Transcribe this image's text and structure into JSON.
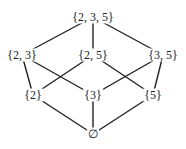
{
  "diagram": {
    "type": "hasse-diagram",
    "line_color": "#222222",
    "nodes": [
      {
        "id": "n235",
        "label": "{2, 3, 5}",
        "x": 93,
        "y": 17
      },
      {
        "id": "n23",
        "label": "{2, 3}",
        "x": 22,
        "y": 55
      },
      {
        "id": "n25",
        "label": "{2, 5}",
        "x": 93,
        "y": 55
      },
      {
        "id": "n35",
        "label": "{3, 5}",
        "x": 163,
        "y": 55
      },
      {
        "id": "n2",
        "label": "{2}",
        "x": 33,
        "y": 95
      },
      {
        "id": "n3",
        "label": "{3}",
        "x": 93,
        "y": 95
      },
      {
        "id": "n5",
        "label": "{5}",
        "x": 153,
        "y": 95
      },
      {
        "id": "nempty",
        "label": "∅",
        "x": 93,
        "y": 134
      }
    ],
    "edges": [
      [
        "n235",
        "n23"
      ],
      [
        "n235",
        "n25"
      ],
      [
        "n235",
        "n35"
      ],
      [
        "n23",
        "n2"
      ],
      [
        "n23",
        "n3"
      ],
      [
        "n25",
        "n2"
      ],
      [
        "n25",
        "n5"
      ],
      [
        "n35",
        "n3"
      ],
      [
        "n35",
        "n5"
      ],
      [
        "n2",
        "nempty"
      ],
      [
        "n3",
        "nempty"
      ],
      [
        "n5",
        "nempty"
      ]
    ]
  }
}
